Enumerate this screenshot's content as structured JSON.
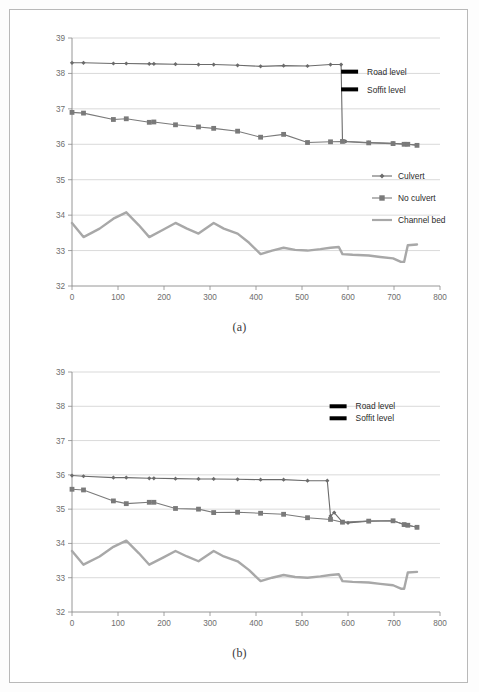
{
  "figures": [
    {
      "id": "a",
      "caption": "(a)",
      "chart_data": {
        "type": "line",
        "title": "",
        "xlabel": "",
        "ylabel": "",
        "xlim": [
          0,
          800
        ],
        "ylim": [
          32,
          39
        ],
        "xticks": [
          0,
          100,
          200,
          300,
          400,
          500,
          600,
          700,
          800
        ],
        "yticks": [
          32,
          33,
          34,
          35,
          36,
          37,
          38,
          39
        ],
        "grid": true,
        "legend_position": "center-right",
        "annotations": [
          {
            "label": "Road level",
            "x": 585,
            "y": 38.05,
            "marker": "thick-bar"
          },
          {
            "label": "Soffit level",
            "x": 585,
            "y": 37.55,
            "marker": "thick-bar"
          }
        ],
        "series": [
          {
            "name": "Culvert",
            "marker": "diamond",
            "color": "#6b6b6b",
            "x": [
              0,
              25,
              90,
              118,
              168,
              178,
              225,
              275,
              308,
              360,
              410,
              460,
              512,
              562,
              585,
              588,
              595,
              645,
              698,
              722,
              730,
              750
            ],
            "y": [
              38.3,
              38.3,
              38.28,
              38.28,
              38.27,
              38.27,
              38.26,
              38.25,
              38.25,
              38.23,
              38.2,
              38.22,
              38.21,
              38.25,
              38.25,
              36.1,
              36.08,
              36.05,
              36.03,
              36.01,
              36.0,
              35.98
            ]
          },
          {
            "name": "No culvert",
            "marker": "square",
            "color": "#7a7a7a",
            "x": [
              0,
              25,
              90,
              118,
              168,
              178,
              225,
              275,
              308,
              360,
              410,
              460,
              512,
              562,
              588,
              645,
              698,
              722,
              730,
              750
            ],
            "y": [
              36.9,
              36.88,
              36.7,
              36.72,
              36.62,
              36.63,
              36.55,
              36.49,
              36.45,
              36.37,
              36.2,
              36.28,
              36.05,
              36.07,
              36.08,
              36.04,
              36.02,
              36.0,
              36.0,
              35.97
            ]
          },
          {
            "name": "Channel bed",
            "marker": "none",
            "color": "#a8a8a8",
            "x": [
              0,
              25,
              60,
              90,
              118,
              145,
              168,
              200,
              225,
              250,
              275,
              308,
              330,
              360,
              385,
              410,
              435,
              460,
              485,
              512,
              540,
              562,
              580,
              588,
              610,
              645,
              670,
              698,
              715,
              722,
              730,
              750
            ],
            "y": [
              33.78,
              33.38,
              33.62,
              33.9,
              34.08,
              33.72,
              33.38,
              33.6,
              33.78,
              33.62,
              33.48,
              33.78,
              33.62,
              33.48,
              33.22,
              32.9,
              33.0,
              33.08,
              33.02,
              33.0,
              33.04,
              33.08,
              33.1,
              32.9,
              32.88,
              32.86,
              32.82,
              32.78,
              32.68,
              32.68,
              33.15,
              33.17
            ]
          }
        ]
      },
      "legend": [
        {
          "label": "Culvert",
          "marker": "diamond",
          "color": "#6b6b6b"
        },
        {
          "label": "No culvert",
          "marker": "square",
          "color": "#7a7a7a"
        },
        {
          "label": "Channel bed",
          "marker": "line",
          "color": "#a8a8a8"
        }
      ]
    },
    {
      "id": "b",
      "caption": "(b)",
      "chart_data": {
        "type": "line",
        "title": "",
        "xlabel": "",
        "ylabel": "",
        "xlim": [
          0,
          800
        ],
        "ylim": [
          32,
          39
        ],
        "xticks": [
          0,
          100,
          200,
          300,
          400,
          500,
          600,
          700,
          800
        ],
        "yticks": [
          32,
          33,
          34,
          35,
          36,
          37,
          38,
          39
        ],
        "grid": true,
        "legend_position": "top-right",
        "annotations": [
          {
            "label": "Road level",
            "x": 560,
            "y": 38.0,
            "marker": "thick-bar"
          },
          {
            "label": "Soffit level",
            "x": 560,
            "y": 37.65,
            "marker": "thick-bar"
          }
        ],
        "series": [
          {
            "name": "Culvert",
            "marker": "diamond",
            "color": "#6b6b6b",
            "x": [
              0,
              25,
              90,
              118,
              168,
              178,
              225,
              275,
              308,
              360,
              410,
              460,
              512,
              555,
              562,
              570,
              588,
              600,
              645,
              698,
              722,
              730,
              750
            ],
            "y": [
              35.98,
              35.96,
              35.92,
              35.92,
              35.9,
              35.9,
              35.89,
              35.88,
              35.88,
              35.87,
              35.86,
              35.86,
              35.83,
              35.83,
              34.8,
              34.9,
              34.62,
              34.6,
              34.65,
              34.66,
              34.55,
              34.53,
              34.47
            ]
          },
          {
            "name": "No culvert",
            "marker": "square",
            "color": "#7a7a7a",
            "x": [
              0,
              25,
              90,
              118,
              168,
              178,
              225,
              275,
              308,
              360,
              410,
              460,
              512,
              562,
              588,
              645,
              698,
              722,
              730,
              750
            ],
            "y": [
              35.58,
              35.56,
              35.24,
              35.16,
              35.2,
              35.2,
              35.02,
              35.0,
              34.9,
              34.91,
              34.88,
              34.85,
              34.75,
              34.7,
              34.62,
              34.65,
              34.66,
              34.55,
              34.53,
              34.47
            ]
          },
          {
            "name": "Channel bed",
            "marker": "none",
            "color": "#a8a8a8",
            "x": [
              0,
              25,
              60,
              90,
              118,
              145,
              168,
              200,
              225,
              250,
              275,
              308,
              330,
              360,
              385,
              410,
              435,
              460,
              485,
              512,
              540,
              562,
              580,
              588,
              610,
              645,
              670,
              698,
              715,
              722,
              730,
              750
            ],
            "y": [
              33.78,
              33.38,
              33.62,
              33.9,
              34.08,
              33.72,
              33.38,
              33.6,
              33.78,
              33.62,
              33.48,
              33.78,
              33.62,
              33.48,
              33.22,
              32.9,
              33.0,
              33.08,
              33.02,
              33.0,
              33.04,
              33.08,
              33.1,
              32.9,
              32.88,
              32.86,
              32.82,
              32.78,
              32.68,
              32.68,
              33.15,
              33.17
            ]
          }
        ]
      },
      "legend": []
    }
  ],
  "colors": {
    "culvert": "#6b6b6b",
    "no_culvert": "#7a7a7a",
    "channel_bed": "#a8a8a8",
    "gridline": "#c9c9c9",
    "axis": "#8a8a8a",
    "annotation_bar": "#000000",
    "page_border": "#b9b9b9"
  }
}
